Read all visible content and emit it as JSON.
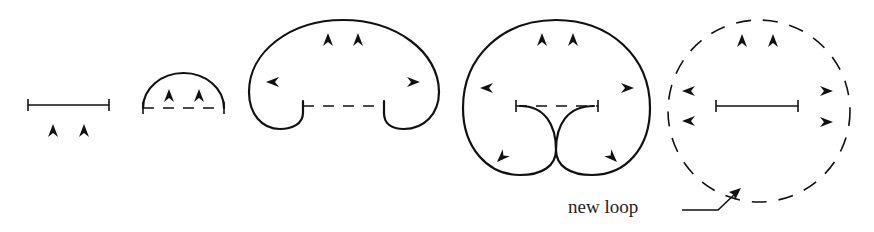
{
  "figure": {
    "stages": [
      {
        "id": 1,
        "shape": "straight segment",
        "arrows": [
          "up",
          "up"
        ]
      },
      {
        "id": 2,
        "shape": "semicircular bow-out",
        "arrows": [
          "up",
          "up"
        ]
      },
      {
        "id": 3,
        "shape": "kidney-shaped expansion",
        "arrows": [
          "up",
          "up",
          "left",
          "right"
        ]
      },
      {
        "id": 4,
        "shape": "loop pinching at bottom",
        "arrows": [
          "up",
          "up",
          "left",
          "right",
          "down-left",
          "down-right"
        ]
      },
      {
        "id": 5,
        "shape": "dashed closed loop with restored segment",
        "arrows": [
          "up",
          "up",
          "left",
          "left",
          "right",
          "right"
        ]
      }
    ],
    "annotation": {
      "label": "new loop",
      "points_to": "stage-5-dashed-loop"
    },
    "colors": {
      "ink": "#111111",
      "background": "#ffffff"
    }
  }
}
